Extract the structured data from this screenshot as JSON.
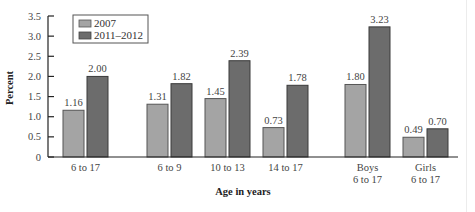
{
  "chart_data": {
    "type": "bar",
    "title": "",
    "xlabel": "Age in years",
    "ylabel": "Percent",
    "ylim": [
      0,
      3.5
    ],
    "yticks": [
      "0",
      "0.5",
      "1.0",
      "1.5",
      "2.0",
      "2.5",
      "3.0",
      "3.5"
    ],
    "grid": false,
    "legend_position": "top-left",
    "categories": [
      "6 to 17",
      "6 to 9",
      "10 to 13",
      "14 to 17",
      "Boys\n6 to 17",
      "Girls\n6 to 17"
    ],
    "category_lines": [
      [
        "6 to 17"
      ],
      [
        "6 to 9"
      ],
      [
        "10 to 13"
      ],
      [
        "14 to 17"
      ],
      [
        "Boys",
        "6 to 17"
      ],
      [
        "Girls",
        "6 to 17"
      ]
    ],
    "series": [
      {
        "name": "2007",
        "color": "#a4a4a4",
        "values": [
          1.16,
          1.31,
          1.45,
          0.73,
          1.8,
          0.49
        ],
        "labels": [
          "1.16",
          "1.31",
          "1.45",
          "0.73",
          "1.80",
          "0.49"
        ]
      },
      {
        "name": "2011–2012",
        "color": "#6c6c6c",
        "values": [
          2.0,
          1.82,
          2.39,
          1.78,
          3.23,
          0.7
        ],
        "labels": [
          "2.00",
          "1.82",
          "2.39",
          "1.78",
          "3.23",
          "0.70"
        ]
      }
    ]
  },
  "legend": {
    "items": [
      {
        "label": "2007",
        "color": "#a4a4a4"
      },
      {
        "label": "2011–2012",
        "color": "#6c6c6c"
      }
    ]
  }
}
